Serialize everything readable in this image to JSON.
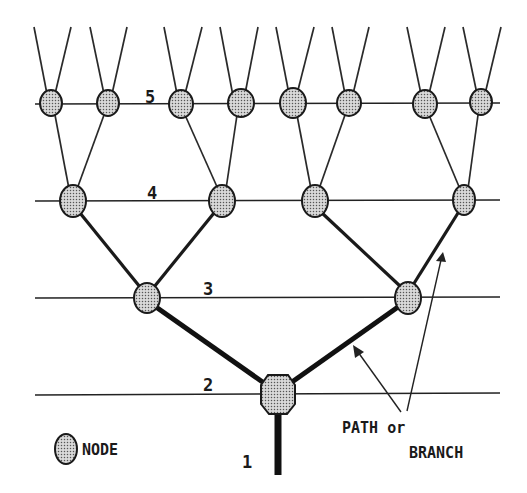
{
  "diagram": {
    "levels": [
      {
        "id": 1,
        "label": "1"
      },
      {
        "id": 2,
        "label": "2"
      },
      {
        "id": 3,
        "label": "3"
      },
      {
        "id": 4,
        "label": "4"
      },
      {
        "id": 5,
        "label": "5"
      }
    ],
    "legend": {
      "node_label": "NODE",
      "path_label_line1": "PATH or",
      "path_label_line2": "BRANCH"
    },
    "nodes": {
      "level2": [
        {
          "x": 278,
          "y": 394
        }
      ],
      "level3": [
        {
          "x": 147,
          "y": 297
        },
        {
          "x": 408,
          "y": 297
        }
      ],
      "level4": [
        {
          "x": 73,
          "y": 201
        },
        {
          "x": 222,
          "y": 201
        },
        {
          "x": 315,
          "y": 201
        },
        {
          "x": 464,
          "y": 201
        }
      ],
      "level5": [
        {
          "x": 51,
          "y": 103
        },
        {
          "x": 108,
          "y": 103
        },
        {
          "x": 181,
          "y": 103
        },
        {
          "x": 241,
          "y": 103
        },
        {
          "x": 293,
          "y": 103
        },
        {
          "x": 349,
          "y": 103
        },
        {
          "x": 425,
          "y": 103
        },
        {
          "x": 481,
          "y": 103
        }
      ]
    },
    "colors": {
      "line": "#1a1a1a",
      "node_fill": "#c8c8c8",
      "background": "#ffffff"
    }
  }
}
